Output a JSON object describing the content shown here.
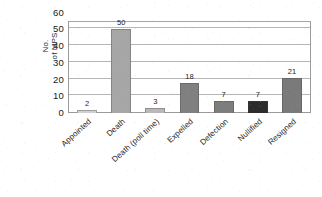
{
  "chart_data": {
    "type": "bar",
    "title": "",
    "xlabel": "",
    "ylabel": "No. of MPS",
    "ylabel_line1": "No.",
    "ylabel_line2": "of MPS",
    "ylim": [
      0,
      60
    ],
    "ytick_step": 10,
    "yticks": [
      "60",
      "50",
      "40",
      "30",
      "20",
      "10",
      "0"
    ],
    "grid": true,
    "legend": "none",
    "categories": [
      "Appointed",
      "Death",
      "Death (poll time)",
      "Expelled",
      "Defection",
      "Nullified",
      "Resigned"
    ],
    "values": [
      2,
      50,
      3,
      18,
      7,
      7,
      21
    ],
    "value_labels": [
      "2",
      "50",
      "3",
      "18",
      "7",
      "7",
      "21"
    ],
    "bar_colors": [
      "#cfcfcf",
      "#a6a6a6",
      "#b8b8b8",
      "#808080",
      "#7d7d7d",
      "#2c2c2c",
      "#7a7a7a"
    ]
  },
  "style": {
    "plot_border_color": "#9a9a9a",
    "gridline_color": "#b5b5b5",
    "text_color": "#1f1f1f",
    "background": "#ffffff"
  }
}
